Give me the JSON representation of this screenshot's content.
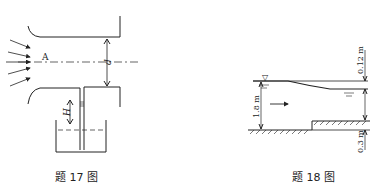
{
  "figure17": {
    "caption": "题 17 图",
    "label_point": "A",
    "label_diameter": "d",
    "label_height": "H"
  },
  "figure18": {
    "caption": "题 18 图",
    "label_drop": "0.12 m",
    "label_depth": "1.8 m",
    "label_step": "0.3 m",
    "water_surface_symbol": "▽"
  }
}
